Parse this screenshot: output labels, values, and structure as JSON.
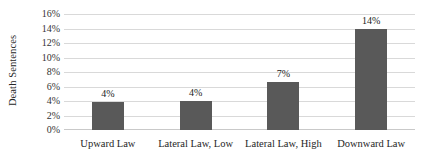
{
  "chart_data": {
    "type": "bar",
    "title": "",
    "xlabel": "",
    "ylabel": "Death Sentences",
    "categories": [
      "Upward Law",
      "Lateral Law, Low",
      "Lateral Law, High",
      "Downward Law"
    ],
    "values": [
      3.8,
      4.0,
      6.6,
      14.0
    ],
    "data_labels": [
      "4%",
      "4%",
      "7%",
      "14%"
    ],
    "ylim": [
      0,
      16
    ],
    "ytick_values": [
      0,
      2,
      4,
      6,
      8,
      10,
      12,
      14,
      16
    ],
    "ytick_labels": [
      "0%",
      "2%",
      "4%",
      "6%",
      "8%",
      "10%",
      "12%",
      "14%",
      "16%"
    ],
    "grid": true,
    "legend": "none",
    "bar_color": "#595959",
    "gridline_color": "#d9d9d9",
    "background_color": "#ffffff"
  }
}
